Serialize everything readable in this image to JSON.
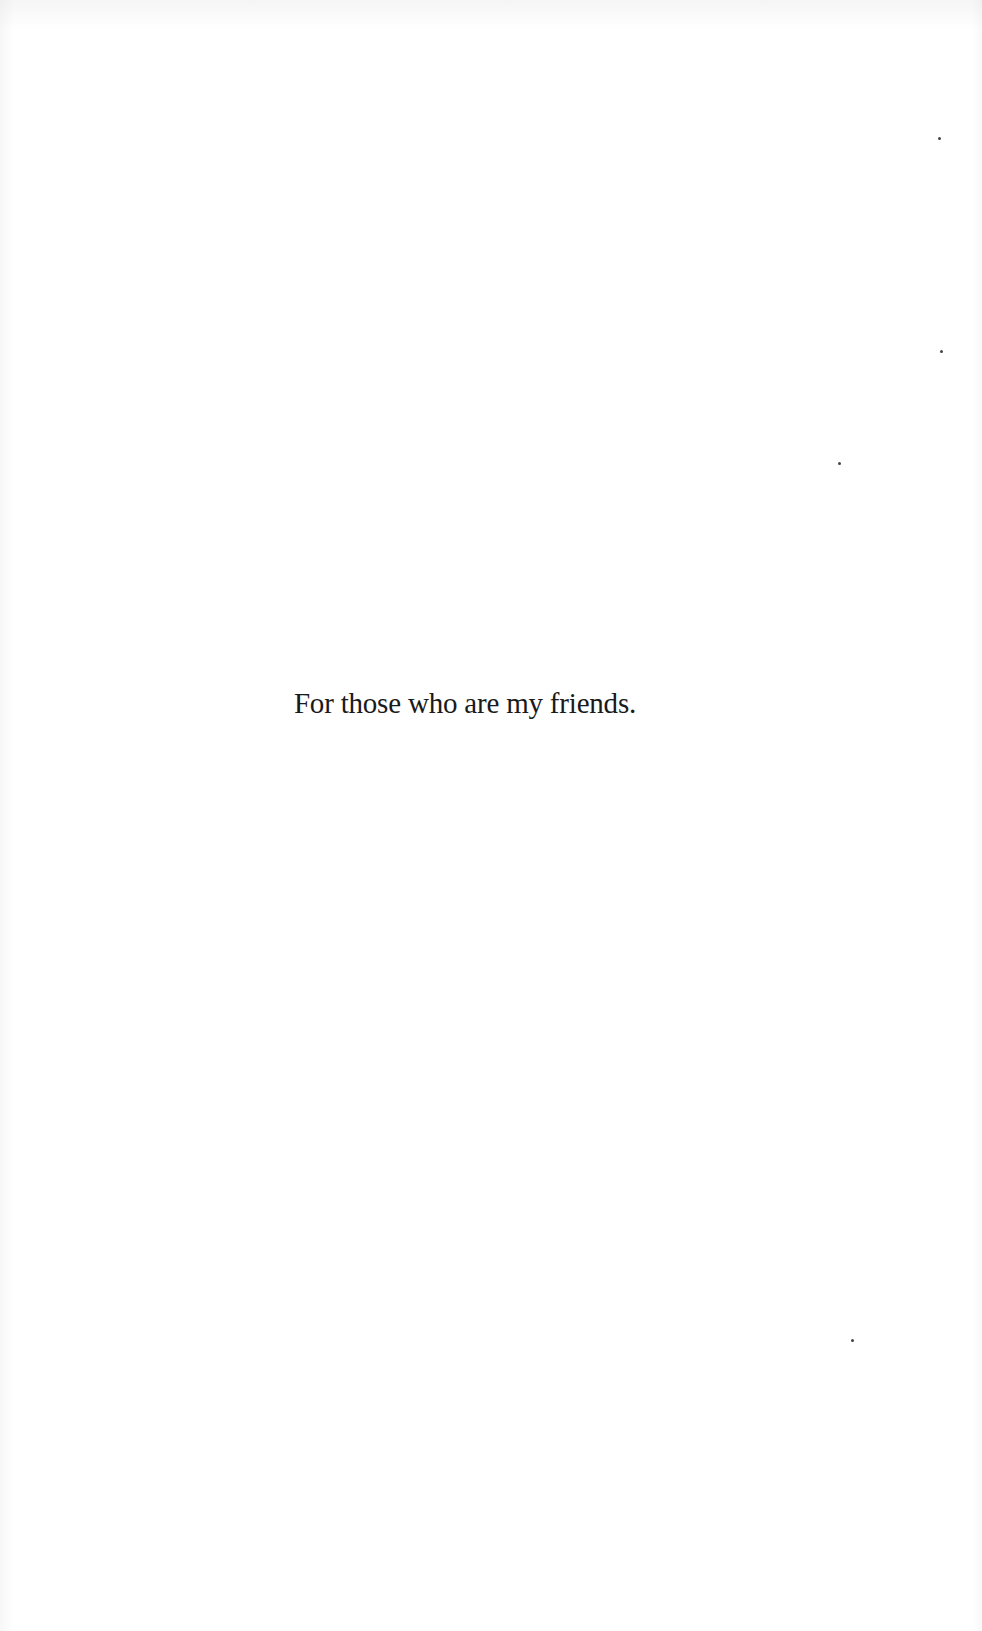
{
  "page": {
    "type": "dedication",
    "text": "For those who are my friends."
  },
  "colors": {
    "background": "#ffffff",
    "text": "#1a1a1a"
  }
}
